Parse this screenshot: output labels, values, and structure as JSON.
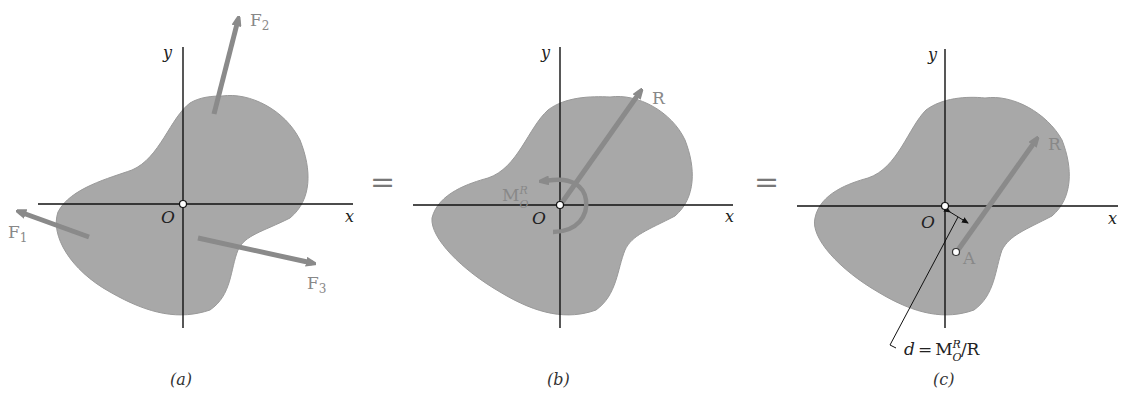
{
  "figure": {
    "panels": [
      {
        "id": "a",
        "caption": "(a)",
        "axis_x": "x",
        "axis_y": "y",
        "origin": "O",
        "forces": [
          {
            "label": "F",
            "sub": "1"
          },
          {
            "label": "F",
            "sub": "2"
          },
          {
            "label": "F",
            "sub": "3"
          }
        ]
      },
      {
        "id": "b",
        "caption": "(b)",
        "axis_x": "x",
        "axis_y": "y",
        "origin": "O",
        "resultant": "R",
        "moment": {
          "label": "M",
          "sub": "O",
          "sup": "R"
        }
      },
      {
        "id": "c",
        "caption": "(c)",
        "axis_x": "x",
        "axis_y": "y",
        "origin": "O",
        "resultant": "R",
        "point": "A",
        "distance": {
          "lhs": "d",
          "eq": "=",
          "M": "M",
          "sub": "O",
          "sup": "R",
          "tail": "/R"
        }
      }
    ],
    "equals": [
      "=",
      "="
    ],
    "colors": {
      "body": "#a8a8a8",
      "arrow": "#8a8a8a",
      "axis": "#111111",
      "background": "#ffffff"
    }
  }
}
